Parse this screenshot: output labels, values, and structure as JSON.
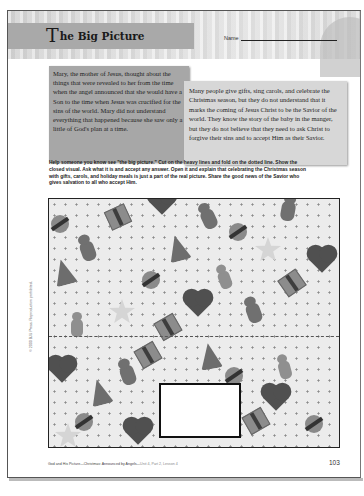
{
  "header": {
    "title_initial": "T",
    "title_rest": "he Big Picture",
    "name_label": "Name"
  },
  "boxes": {
    "mary": "Mary, the mother of Jesus, thought about the things that were revealed to her from the time when the angel announced that she would have a Son to the time when Jesus was crucified for the sins of the world. Mary did not understand everything that happened because she saw only a little of God's plan at a time.",
    "people": "Many people give gifts, sing carols, and celebrate the Christmas season, but they do not understand that it marks the coming of Jesus Christ to be the Savior of the world. They know the story of the baby in the manger, but they do not believe that they need to ask Christ to forgive their sins and to accept Him as their Savior."
  },
  "instructions": "Help someone you know see \"the big picture.\" Cut on the heavy lines and fold on the dotted line. Show the closed visual. Ask what it is and accept any answer. Open it and explain that celebrating the Christmas season with gifts, carols, and holiday meals is just a part of the real picture. Share the good news of the Savior who gives salvation to all who accept Him.",
  "pattern": {
    "motifs": [
      "christmas-tree",
      "gift",
      "heart",
      "teddy-bear",
      "ornament",
      "star",
      "gingerbread-man"
    ]
  },
  "footer": {
    "course": "God and His Picture—Christmas: Announced by Angels—",
    "lesson": "Unit 4, Part 2, Lesson 4",
    "page_number": "103",
    "copyright": "© 2000 BJU Press. Reproduction prohibited."
  }
}
